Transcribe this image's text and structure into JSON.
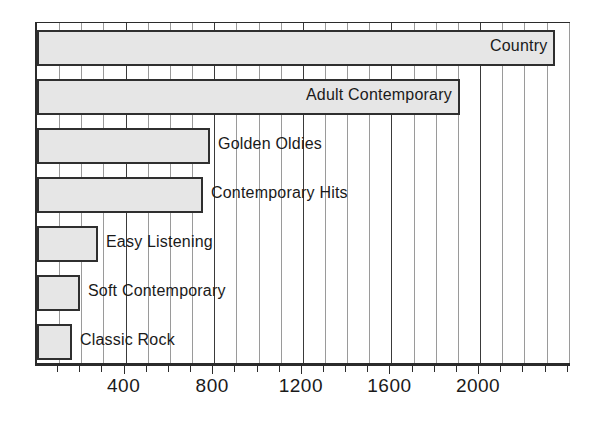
{
  "chart_data": {
    "type": "bar",
    "orientation": "horizontal",
    "title": "",
    "subtitle": "",
    "xlabel": "",
    "ylabel": "",
    "categories": [
      "Country",
      "Adult Contemporary",
      "Golden Oldies",
      "Contemporary Hits",
      "Easy Listening",
      "Soft Contemporary",
      "Classic Rock"
    ],
    "values": [
      2340,
      1910,
      780,
      750,
      275,
      195,
      158
    ],
    "xlim": [
      0,
      2415
    ],
    "x_tick_labels": [
      "400",
      "800",
      "1200",
      "1600",
      "2000"
    ],
    "x_tick_values": [
      400,
      800,
      1200,
      1600,
      2000
    ],
    "minor_tick_step": 100,
    "grid": true,
    "grid_axis": "x",
    "legend": "none",
    "bar_fill_color": "#e6e6e6",
    "bar_border_color": "#2f2f2f",
    "gridline_color": "#9a9a9a",
    "major_gridline_color": "#3a3a3a",
    "axis_color": "#2b2b2b",
    "label_placement": [
      "inside-right",
      "inside-right",
      "outside-right",
      "outside-right",
      "outside-right",
      "outside-right",
      "outside-right"
    ]
  },
  "axis": {
    "ticks": [
      {
        "label": "400"
      },
      {
        "label": "800"
      },
      {
        "label": "1200"
      },
      {
        "label": "1600"
      },
      {
        "label": "2000"
      }
    ]
  },
  "bars": [
    {
      "label": "Country",
      "value": 2340
    },
    {
      "label": "Adult Contemporary",
      "value": 1910
    },
    {
      "label": "Golden Oldies",
      "value": 780
    },
    {
      "label": "Contemporary Hits",
      "value": 750
    },
    {
      "label": "Easy Listening",
      "value": 275
    },
    {
      "label": "Soft Contemporary",
      "value": 195
    },
    {
      "label": "Classic Rock",
      "value": 158
    }
  ]
}
